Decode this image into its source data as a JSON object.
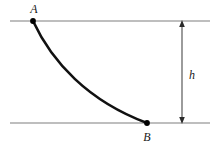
{
  "figure": {
    "type": "physics-diagram",
    "background_color": "#ffffff"
  },
  "colors": {
    "curve": "#111111",
    "point": "#000000",
    "reference_line": "#a8a8a8",
    "dimension_line": "#4a4a4a",
    "label_text": "#1a1a1a"
  },
  "labels": {
    "point_a": "A",
    "point_b": "B",
    "height": "h"
  },
  "geometry": {
    "upper_line": {
      "x1": 10,
      "y1": 21,
      "x2": 210,
      "y2": 21
    },
    "lower_line": {
      "x1": 10,
      "y1": 123,
      "x2": 210,
      "y2": 123
    },
    "point_a": {
      "x": 33,
      "y": 21,
      "r": 2.8
    },
    "point_b": {
      "x": 147,
      "y": 123,
      "r": 2.8
    },
    "curve_path": "M 33 21 C 52 62, 88 101, 147 123",
    "curve_width": 2.6,
    "dimension_arrow": {
      "x": 182,
      "y_top": 21,
      "y_bottom": 123
    },
    "height_label_pos": {
      "x": 189,
      "y": 78
    },
    "label_a_pos": {
      "x": 34,
      "y": 13
    },
    "label_b_pos": {
      "x": 147,
      "y": 140
    }
  }
}
